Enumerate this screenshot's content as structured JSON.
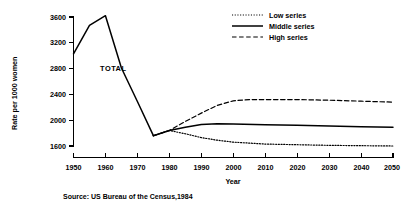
{
  "chart_data": {
    "type": "line",
    "title": "",
    "xlabel": "Year",
    "ylabel": "Rate per 1000 women",
    "xlim": [
      1950,
      2050
    ],
    "ylim": [
      1500,
      3700
    ],
    "xticks": [
      "1950",
      "1960",
      "1970",
      "1980",
      "1990",
      "2000",
      "2010",
      "2020",
      "2030",
      "2040",
      "2050"
    ],
    "yticks": [
      "1600",
      "2000",
      "2400",
      "2800",
      "3200",
      "3600"
    ],
    "grid": false,
    "legend_position": "top-right",
    "annotations": [
      {
        "text": "TOTAL",
        "x": 1962,
        "y": 2800
      }
    ],
    "series": [
      {
        "name": "TOTAL",
        "style": "solid",
        "x": [
          1950,
          1955,
          1960,
          1965,
          1970,
          1975
        ],
        "values": [
          3030,
          3470,
          3620,
          2810,
          2290,
          1760
        ]
      },
      {
        "name": "Low series",
        "style": "dotted",
        "x": [
          1975,
          1980,
          1985,
          1990,
          1995,
          2000,
          2010,
          2020,
          2030,
          2040,
          2050
        ],
        "values": [
          1760,
          1840,
          1790,
          1730,
          1690,
          1660,
          1630,
          1620,
          1610,
          1605,
          1600
        ]
      },
      {
        "name": "Middle series",
        "style": "solid",
        "x": [
          1975,
          1980,
          1985,
          1990,
          1995,
          2000,
          2010,
          2020,
          2030,
          2040,
          2050
        ],
        "values": [
          1760,
          1840,
          1890,
          1935,
          1945,
          1940,
          1930,
          1920,
          1910,
          1900,
          1890
        ]
      },
      {
        "name": "High series",
        "style": "dashed",
        "x": [
          1975,
          1980,
          1985,
          1990,
          1995,
          2000,
          2005,
          2010,
          2020,
          2030,
          2040,
          2050
        ],
        "values": [
          1760,
          1840,
          1980,
          2110,
          2230,
          2300,
          2320,
          2320,
          2320,
          2310,
          2295,
          2280
        ]
      }
    ]
  },
  "legend": {
    "items": [
      {
        "label": "Low series",
        "style": "dotted"
      },
      {
        "label": "Middle series",
        "style": "solid"
      },
      {
        "label": "High series",
        "style": "dashed"
      }
    ]
  },
  "axes": {
    "y_title": "Rate per 1000 women",
    "x_title": "Year",
    "y_ticks": [
      "3600",
      "3200",
      "2800",
      "2400",
      "2000",
      "1600"
    ],
    "x_ticks": [
      "1950",
      "1960",
      "1970",
      "1980",
      "1990",
      "2000",
      "2010",
      "2020",
      "2030",
      "2040",
      "2050"
    ]
  },
  "annotation": {
    "total_label": "TOTAL"
  },
  "footer": {
    "source": "Source: US Bureau of the Census,1984"
  }
}
